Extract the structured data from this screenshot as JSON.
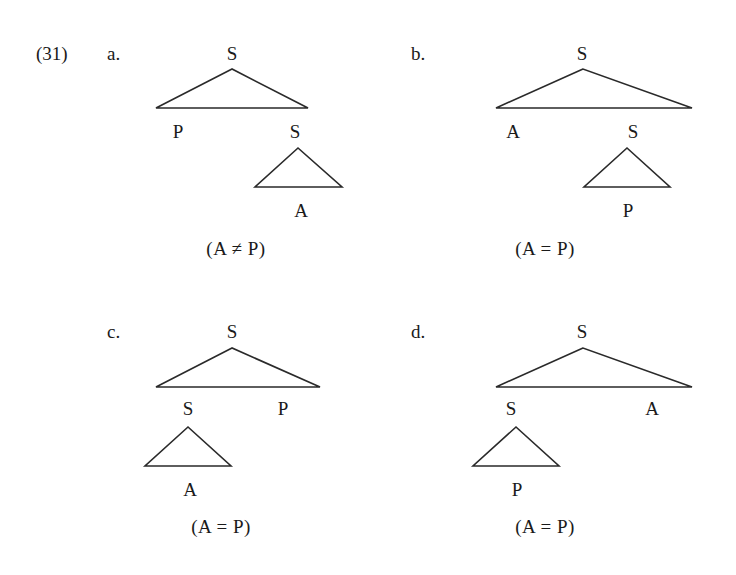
{
  "example": {
    "number": "(31)"
  },
  "panels": [
    {
      "letter": "a.",
      "root": "S",
      "left_child": "P",
      "right_child": "S",
      "subtree_leaf": "A",
      "subtree_under": "right",
      "condition": "(A ≠ P)"
    },
    {
      "letter": "b.",
      "root": "S",
      "left_child": "A",
      "right_child": "S",
      "subtree_leaf": "P",
      "subtree_under": "right",
      "condition": "(A = P)"
    },
    {
      "letter": "c.",
      "root": "S",
      "left_child": "S",
      "right_child": "P",
      "subtree_leaf": "A",
      "subtree_under": "left",
      "condition": "(A = P)"
    },
    {
      "letter": "d.",
      "root": "S",
      "left_child": "S",
      "right_child": "A",
      "subtree_leaf": "P",
      "subtree_under": "left",
      "condition": "(A = P)"
    }
  ]
}
